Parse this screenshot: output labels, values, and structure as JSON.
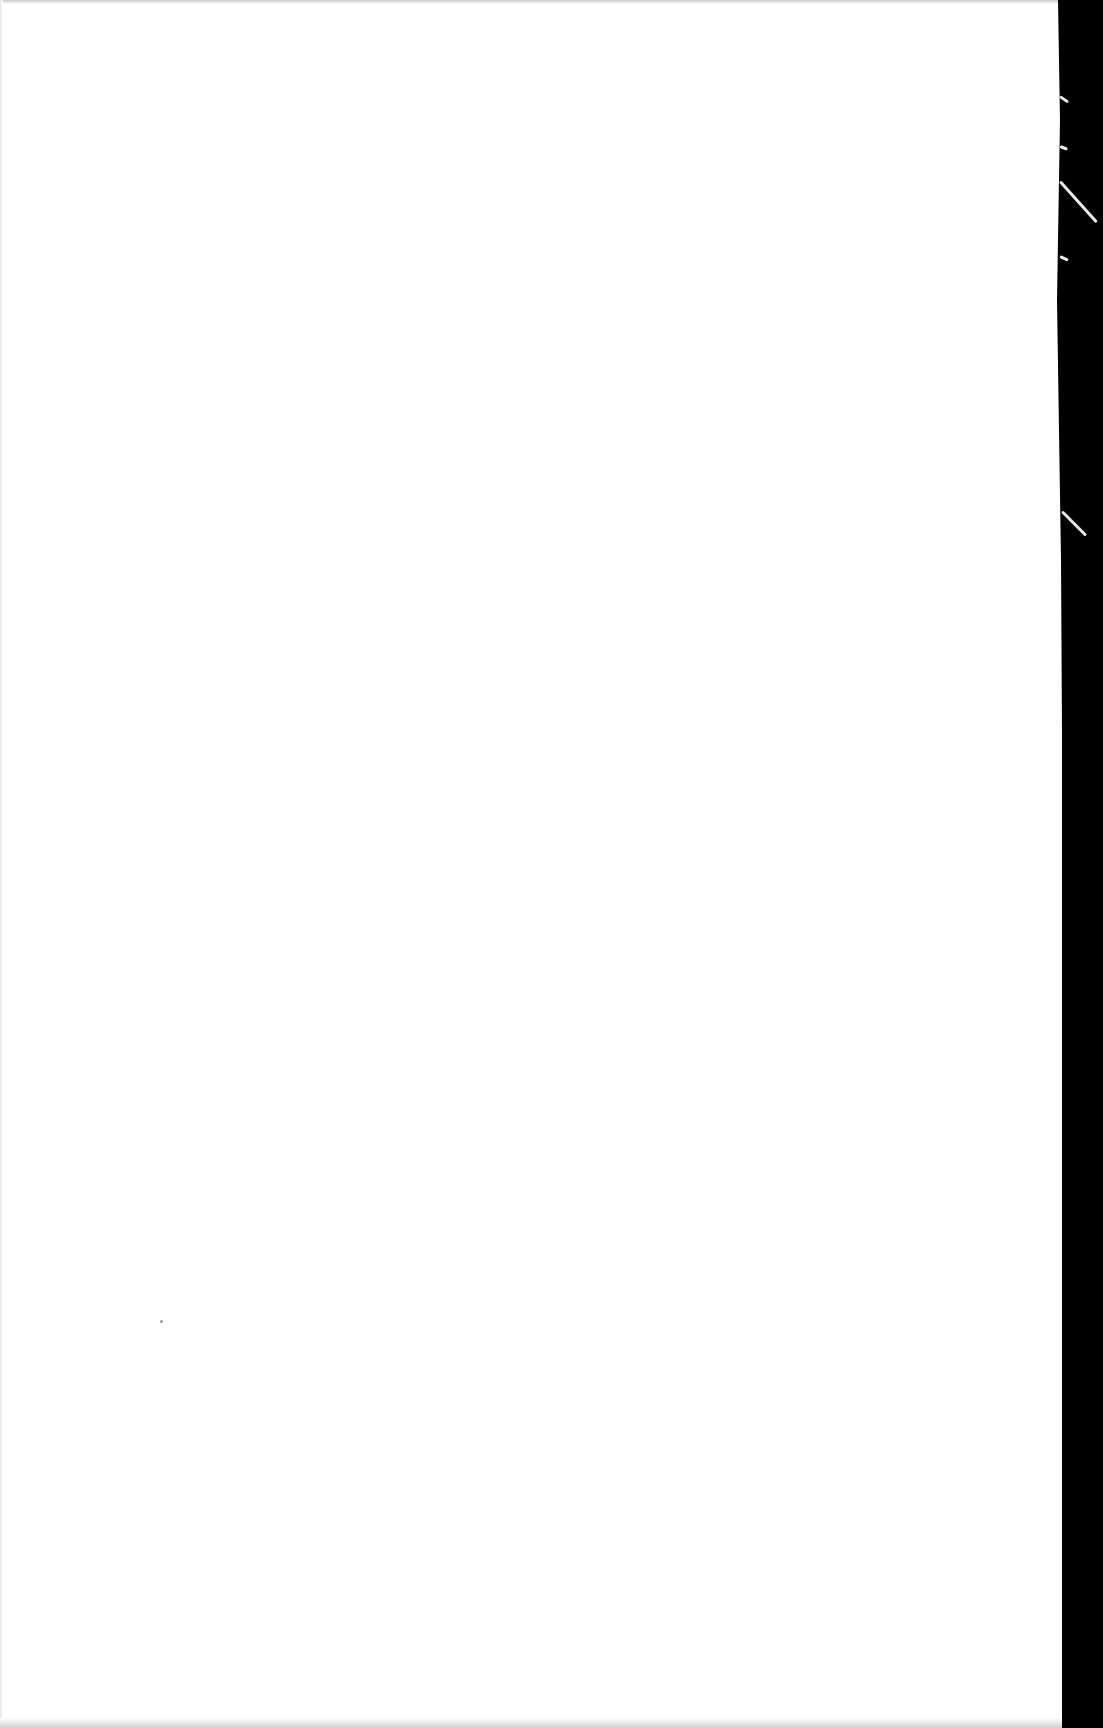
{
  "document": {
    "type": "scanned-page",
    "text_content": [],
    "colors": {
      "paper": "#ffffff",
      "scanner_background": "#000000",
      "edge_shadow": "#c9c9c9"
    }
  }
}
